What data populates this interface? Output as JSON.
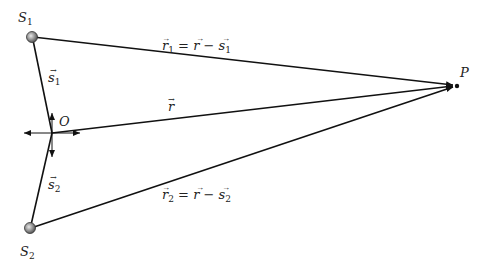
{
  "diagram": {
    "points": {
      "S1": {
        "label": "S",
        "sub": "1",
        "x": 32,
        "y": 37
      },
      "S2": {
        "label": "S",
        "sub": "2",
        "x": 30,
        "y": 228
      },
      "O": {
        "label": "O",
        "x": 52,
        "y": 133
      },
      "P": {
        "label": "P",
        "x": 457,
        "y": 86
      }
    },
    "vectors": {
      "s1": {
        "label": "s",
        "sub": "1"
      },
      "s2": {
        "label": "s",
        "sub": "2"
      },
      "r": {
        "label": "r"
      },
      "r1": {
        "label": "r",
        "sub": "1",
        "eq": "= ",
        "rhs_r": "r",
        "minus": " − ",
        "rhs_s": "s",
        "rhs_sub": "1"
      },
      "r2": {
        "label": "r",
        "sub": "2",
        "eq": "= ",
        "rhs_r": "r",
        "minus": " − ",
        "rhs_s": "s",
        "rhs_sub": "2"
      }
    },
    "colors": {
      "line": "#111111",
      "source_fill": "#9a9a9a",
      "point": "#111111"
    }
  }
}
